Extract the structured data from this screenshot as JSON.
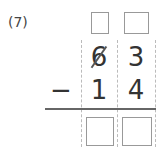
{
  "problem": {
    "number_label": "(7)",
    "operation": "subtraction",
    "operator_symbol": "−",
    "minuend": {
      "tens": "6",
      "ones": "3",
      "tens_crossed_out": true
    },
    "subtrahend": {
      "tens": "1",
      "ones": "4"
    },
    "borrow_boxes": [
      {
        "column": "tens",
        "value": ""
      },
      {
        "column": "ones",
        "value": ""
      }
    ],
    "answer_boxes": [
      {
        "column": "tens",
        "value": ""
      },
      {
        "column": "ones",
        "value": ""
      }
    ]
  }
}
